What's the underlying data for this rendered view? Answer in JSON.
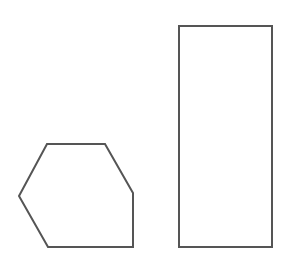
{
  "diagram": {
    "background": "#ffffff",
    "stroke_color": "#555555",
    "stroke_width": 2,
    "shapes": [
      {
        "name": "hexagon",
        "type": "polygon",
        "points": "47,144 105,144 133,193 133,247 48,247 19,196"
      },
      {
        "name": "rectangle",
        "type": "rect",
        "x": 179,
        "y": 26,
        "width": 93,
        "height": 221
      }
    ]
  }
}
